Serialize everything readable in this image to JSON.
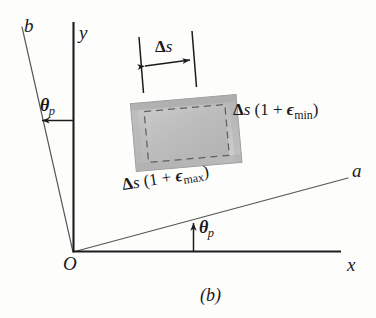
{
  "figure": {
    "caption": "(b)",
    "axes": {
      "y_label": "y",
      "x_label": "x",
      "a_label": "a",
      "b_label": "b",
      "origin_label": "O"
    },
    "angles": {
      "theta_symbol": "θ",
      "theta_subscript": "p",
      "upper_left_label": "θp",
      "lower_label": "θp"
    },
    "dimension": {
      "top_label_delta": "Δ",
      "top_label_s": "s"
    },
    "labels": {
      "min_strain": {
        "delta": "Δ",
        "s": "s",
        "open": " (1 + ",
        "epsilon": "ϵ",
        "subscript": "min",
        "close": ")"
      },
      "max_strain": {
        "delta": "Δ",
        "s": "s",
        "open": " (1 + ",
        "epsilon": "ϵ",
        "subscript": "max",
        "close": ")"
      }
    },
    "colors": {
      "line": "#3a3a3a",
      "axis_heavy": "#1c1c1c",
      "fill_light": "#d8d8d8",
      "fill_mid": "#c2c2c2",
      "fill_dark": "#a8a8a8",
      "dashed": "#6d6d6d",
      "background": "#fdfdfc",
      "text": "#1a1a1a"
    },
    "geometry": {
      "origin": [
        73,
        252
      ],
      "y_axis_top": [
        73,
        22
      ],
      "x_axis_right": [
        340,
        252
      ],
      "a_axis_end": [
        348,
        178
      ],
      "b_axis_end": [
        22,
        27
      ],
      "element_center": [
        186,
        131
      ],
      "element_rotation_deg": -5
    }
  }
}
